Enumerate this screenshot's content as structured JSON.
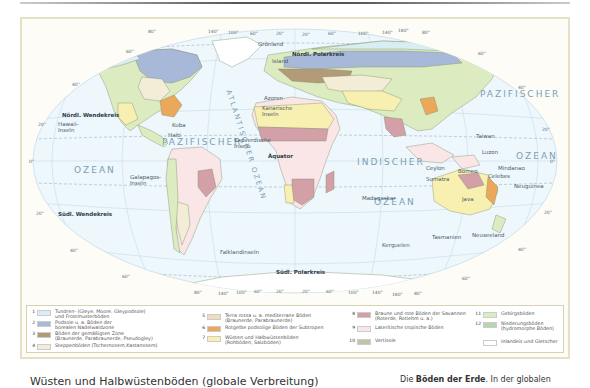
{
  "map": {
    "oceans": {
      "pacific_west_1": "PAZIFISCHER",
      "pacific_west_2": "OZEAN",
      "pacific_east_1": "PAZIFISCHER",
      "pacific_east_2": "OZEAN",
      "atlantic": "ATLANTISCHER OZEAN",
      "indian_1": "INDISCHER",
      "indian_2": "OZEAN"
    },
    "lines": {
      "north_polar": "Nördl. Polarkreis",
      "north_tropic": "Nördl. Wendekreis",
      "equator": "Äquator",
      "south_tropic": "Südl. Wendekreis",
      "south_polar": "Südl. Polarkreis"
    },
    "places": {
      "groenland": "Grönland",
      "island": "Island",
      "azoren": "Azoren",
      "kanarische": "Kanarische Inseln",
      "kapverdische": "Kapverdische Inseln",
      "hawaii": "Hawaii-Inseln",
      "kuba": "Kuba",
      "haiti": "Haiti",
      "galapagos": "Galapagos-Inseln",
      "falkland": "Falklandinseln",
      "madagaskar": "Madagaskar",
      "kerguelen": "Kerguelen",
      "taiwan": "Taiwan",
      "luzon": "Luzon",
      "mindanao": "Mindanao",
      "ceylon": "Ceylon",
      "borneo": "Borneo",
      "celebes": "Celebes",
      "sumatra": "Sumatra",
      "java": "Java",
      "neuguinea": "Neuguinea",
      "tasmanien": "Tasmanien",
      "neuseeland": "Neuseeland"
    },
    "degrees": {
      "top": [
        "80°",
        "140°",
        "100°",
        "60°",
        "20°",
        "20°",
        "60°",
        "100°",
        "140°",
        "180°",
        "80°"
      ],
      "bottom": [
        "80°",
        "140°",
        "100°",
        "60°",
        "20°",
        "20°",
        "60°",
        "100°",
        "140°",
        "180°",
        "80°"
      ],
      "left": [
        "60°",
        "40°",
        "20°",
        "0°",
        "20°",
        "40°",
        "60°"
      ],
      "right": [
        "60°",
        "40°",
        "20°",
        "0°",
        "20°",
        "40°",
        "60°"
      ]
    }
  },
  "legend": {
    "items": [
      {
        "num": "1",
        "color": "#d9eef2",
        "line1": "Tundren- (Gleye, Moore, Gleypodsole)",
        "line2": "und Frostmusterböden"
      },
      {
        "num": "2",
        "color": "#a8b8d8",
        "line1": "Podsole u. a. Böden der",
        "line2": "borealen Nadelwaldzone"
      },
      {
        "num": "3",
        "color": "#b39a78",
        "line1": "Böden der gemäßigten Zone",
        "line2": "(Braunerde, Parabraunerde, Pseudogley)"
      },
      {
        "num": "4",
        "color": "#f3ecd6",
        "line1": "Steppenböden (Tschernosem,Kastanosem)",
        "line2": ""
      },
      {
        "num": "5",
        "color": "#f0dcc0",
        "line1": "Terra rossa u. a. mediterrane Böden",
        "line2": "(Braunerde, Parabraunerde)"
      },
      {
        "num": "6",
        "color": "#eba85a",
        "line1": "Rotgelbe podsolige Böden der Subtropen",
        "line2": ""
      },
      {
        "num": "7",
        "color": "#f8f0b0",
        "line1": "Wüsten und Halbwüstenböden",
        "line2": "(Rohböden, Salzböden)"
      },
      {
        "num": "8",
        "color": "#d4a0a8",
        "line1": "Braune und rote Böden der Savannen",
        "line2": "(Roterde, Rotlehm u. a.)"
      },
      {
        "num": "9",
        "color": "#fae6e6",
        "line1": "Lateritische tropische Böden",
        "line2": ""
      },
      {
        "num": "10",
        "color": "#c0c4a8",
        "line1": "Vertisole",
        "line2": ""
      },
      {
        "num": "11",
        "color": "#dcecc0",
        "line1": "Gebirgsböden",
        "line2": ""
      },
      {
        "num": "12",
        "color": "#b8d4b0",
        "line1": "Niederungsböden",
        "line2": "(hydromorphe Böden)"
      },
      {
        "num": "",
        "color": "#ffffff",
        "line1": "Inlandeis und Gletscher",
        "line2": ""
      }
    ]
  },
  "caption": {
    "left": "Wüsten und Halbwüstenböden (globale Verbreitung)",
    "right_bold": "Böden der Erde",
    "right_rest": ". In der globalen"
  }
}
